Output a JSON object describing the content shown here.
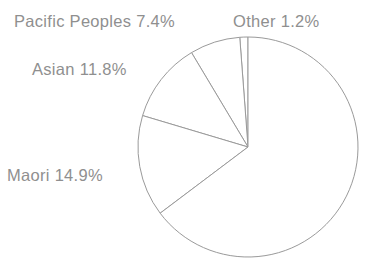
{
  "figure": {
    "name": "ethnicity-pie-chart",
    "background_color": "#ffffff",
    "stroke_color": "#9a9a9a",
    "text_color": "#8f8f8f"
  },
  "geometry": {
    "center_x": 248,
    "center_y": 147,
    "radius": 110
  },
  "labels": {
    "pacific_peoples": "Pacific Peoples 7.4%",
    "other": "Other 1.2%",
    "asian": "Asian 11.8%",
    "maori": "Maori 14.9%"
  },
  "chart_data": {
    "type": "pie",
    "title": "",
    "subtitle": "",
    "xlabel": "",
    "ylabel": "",
    "legend_position": "none",
    "grid": false,
    "labels_shown_on": "slices-external",
    "start_angle_deg_from_top": 0,
    "direction": "counterclockwise",
    "value_unit": "percent",
    "categories": [
      "Other",
      "European/Unlabelled",
      "Maori",
      "Asian",
      "Pacific Peoples"
    ],
    "values": [
      1.2,
      64.7,
      14.9,
      11.8,
      7.4
    ],
    "slices": [
      {
        "name": "Other",
        "label": "Other 1.2%",
        "value": 1.2,
        "labelled": true,
        "start_deg_from_top": 0.0,
        "sweep_deg": 4.3,
        "fill": "#ffffff"
      },
      {
        "name": "Pacific Peoples",
        "label": "Pacific Peoples 7.4%",
        "value": 7.4,
        "labelled": true,
        "start_deg_from_top": 4.3,
        "sweep_deg": 26.6,
        "fill": "#ffffff"
      },
      {
        "name": "Asian",
        "label": "Asian 11.8%",
        "value": 11.8,
        "labelled": true,
        "start_deg_from_top": 30.9,
        "sweep_deg": 42.5,
        "fill": "#ffffff"
      },
      {
        "name": "Maori",
        "label": "Maori 14.9%",
        "value": 14.9,
        "labelled": true,
        "start_deg_from_top": 73.4,
        "sweep_deg": 53.6,
        "fill": "#ffffff"
      },
      {
        "name": "European/Unlabelled",
        "label": "",
        "value": 64.7,
        "labelled": false,
        "start_deg_from_top": 127.0,
        "sweep_deg": 233.0,
        "fill": "#ffffff"
      }
    ]
  }
}
